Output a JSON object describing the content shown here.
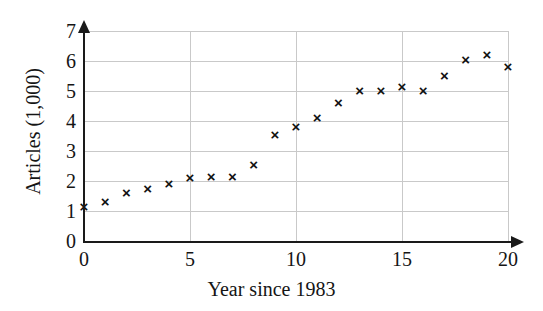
{
  "chart_data": {
    "type": "scatter",
    "title": "",
    "xlabel": "Year since 1983",
    "ylabel": "Articles (1,000)",
    "xlim": [
      0,
      20
    ],
    "ylim": [
      0,
      7
    ],
    "xticks": [
      0,
      5,
      10,
      15,
      20
    ],
    "yticks": [
      0,
      1,
      2,
      3,
      4,
      5,
      6,
      7
    ],
    "grid": true,
    "legend": false,
    "marker": "x",
    "marker_color": "#111111",
    "axis_color": "#1a1a1a",
    "grid_color": "#c9c9c9",
    "x": [
      0,
      1,
      2,
      3,
      4,
      5,
      6,
      7,
      8,
      9,
      10,
      11,
      12,
      13,
      14,
      15,
      16,
      17,
      18,
      19,
      20
    ],
    "y": [
      1.15,
      1.3,
      1.6,
      1.75,
      1.9,
      2.1,
      2.15,
      2.15,
      2.55,
      3.55,
      3.8,
      4.1,
      4.6,
      5.0,
      5.0,
      5.15,
      5.0,
      5.5,
      6.05,
      6.2,
      5.8
    ],
    "points": [
      {
        "x": 0,
        "y": 1.15
      },
      {
        "x": 1,
        "y": 1.3
      },
      {
        "x": 2,
        "y": 1.6
      },
      {
        "x": 3,
        "y": 1.75
      },
      {
        "x": 4,
        "y": 1.9
      },
      {
        "x": 5,
        "y": 2.1
      },
      {
        "x": 6,
        "y": 2.15
      },
      {
        "x": 7,
        "y": 2.15
      },
      {
        "x": 8,
        "y": 2.55
      },
      {
        "x": 9,
        "y": 3.55
      },
      {
        "x": 10,
        "y": 3.8
      },
      {
        "x": 11,
        "y": 4.1
      },
      {
        "x": 12,
        "y": 4.6
      },
      {
        "x": 13,
        "y": 5.0
      },
      {
        "x": 14,
        "y": 5.0
      },
      {
        "x": 15,
        "y": 5.15
      },
      {
        "x": 16,
        "y": 5.0
      },
      {
        "x": 17,
        "y": 5.5
      },
      {
        "x": 18,
        "y": 6.05
      },
      {
        "x": 19,
        "y": 6.2
      },
      {
        "x": 20,
        "y": 5.8
      }
    ],
    "marker_glyph": "×"
  }
}
